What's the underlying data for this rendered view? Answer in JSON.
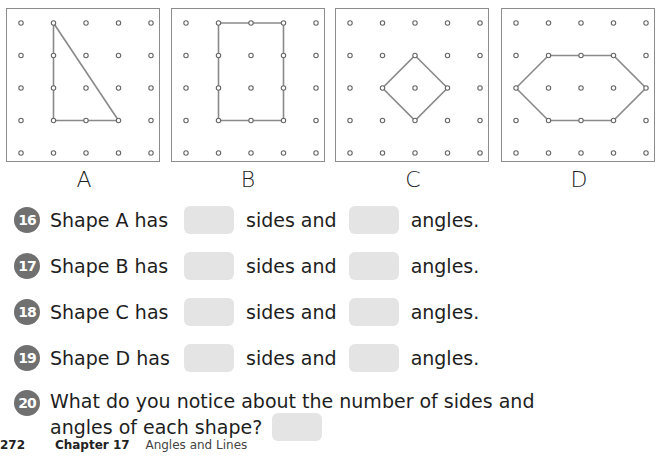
{
  "panels": [
    {
      "label": "A",
      "shape": "triangle",
      "points": [
        [
          1,
          0
        ],
        [
          1,
          3
        ],
        [
          3,
          3
        ]
      ]
    },
    {
      "label": "B",
      "shape": "rectangle",
      "points": [
        [
          1,
          0
        ],
        [
          3,
          0
        ],
        [
          3,
          3
        ],
        [
          1,
          3
        ]
      ]
    },
    {
      "label": "C",
      "shape": "square",
      "points": [
        [
          2,
          1
        ],
        [
          3,
          2
        ],
        [
          2,
          3
        ],
        [
          1,
          2
        ]
      ]
    },
    {
      "label": "D",
      "shape": "hexagon",
      "points": [
        [
          0,
          2
        ],
        [
          1,
          1
        ],
        [
          3,
          1
        ],
        [
          4,
          2
        ],
        [
          3,
          3
        ],
        [
          1,
          3
        ]
      ]
    }
  ],
  "questions": [
    {
      "number": "16",
      "prefix": "Shape A has",
      "middle": "sides and",
      "suffix": "angles."
    },
    {
      "number": "17",
      "prefix": "Shape B has",
      "middle": "sides and",
      "suffix": "angles."
    },
    {
      "number": "18",
      "prefix": "Shape C has",
      "middle": "sides and",
      "suffix": "angles."
    },
    {
      "number": "19",
      "prefix": "Shape D has",
      "middle": "sides and",
      "suffix": "angles."
    }
  ],
  "question20": {
    "number": "20",
    "line1": "What do you notice about the number of sides and",
    "line2": "angles of each shape?"
  },
  "footer": {
    "page": "272",
    "chapter": "Chapter 17",
    "topic": "Angles and Lines"
  },
  "colors": {
    "badge": "#707070",
    "answer_box": "#e4e4e4",
    "panel_border": "#8c8c8c",
    "line": "#8a8a8a"
  }
}
